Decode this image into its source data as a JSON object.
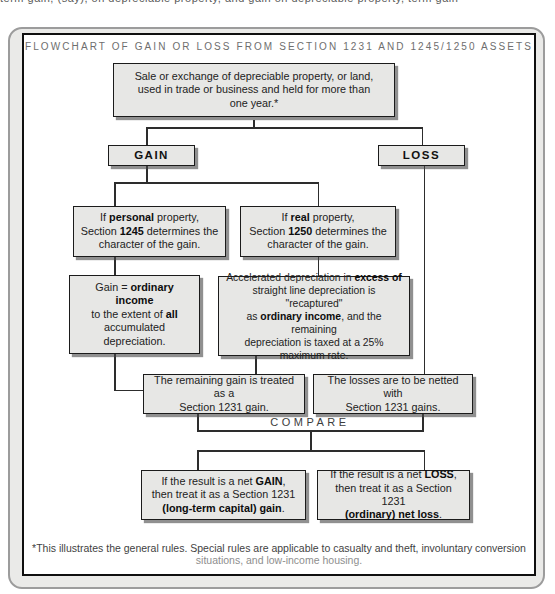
{
  "title": "FLOWCHART OF GAIN OR LOSS FROM SECTION 1231 AND 1245/1250 ASSETS",
  "top_cropped_line": "term gain, (say), on depreciable property, and gain on depreciable property, term gain",
  "compare_label": "COMPARE",
  "footnote": {
    "line1": "*This illustrates the general rules. Special rules are applicable to casualty and theft, involuntary conversion",
    "line2": "situations, and low-income housing."
  },
  "colors": {
    "box_fill": "#e7e7e5",
    "box_border": "#1b1b1b",
    "box_shadow": "#6f6f6f",
    "panel_fill": "#eaeae8",
    "panel_border": "#9c9c9c",
    "inner_border": "#0f0f0f",
    "connector": "#2d2d2d",
    "title_text": "#6e6e6e",
    "body_text": "#222222"
  },
  "nodes": {
    "intro": {
      "segments": [
        {
          "t": "Sale or exchange of depreciable property, or land,\nused in trade or business and held for more than\none year.*"
        }
      ]
    },
    "gain": {
      "label": "GAIN"
    },
    "loss": {
      "label": "LOSS"
    },
    "p1245": {
      "segments": [
        {
          "t": "If "
        },
        {
          "t": "personal",
          "b": true
        },
        {
          "t": " property,\nSection "
        },
        {
          "t": "1245",
          "b": true
        },
        {
          "t": " determines the\ncharacter of the gain."
        }
      ]
    },
    "p1250": {
      "segments": [
        {
          "t": "If "
        },
        {
          "t": "real",
          "b": true
        },
        {
          "t": " property,\nSection "
        },
        {
          "t": "1250",
          "b": true
        },
        {
          "t": " determines the\ncharacter of the gain."
        }
      ]
    },
    "gain_ordinary": {
      "segments": [
        {
          "t": "Gain = "
        },
        {
          "t": "ordinary income",
          "b": true
        },
        {
          "t": "\nto the extent of "
        },
        {
          "t": "all",
          "b": true
        },
        {
          "t": "\naccumulated depreciation."
        }
      ]
    },
    "accelerated": {
      "segments": [
        {
          "t": "Accelerated depreciation in "
        },
        {
          "t": "excess of",
          "b": true
        },
        {
          "t": "\nstraight line depreciation is \"recaptured\"\nas "
        },
        {
          "t": "ordinary income",
          "b": true
        },
        {
          "t": ", and the remaining\ndepreciation is taxed at a 25%\nmaximum rate."
        }
      ]
    },
    "remaining_gain": {
      "segments": [
        {
          "t": "The remaining gain is treated as a\nSection 1231 gain."
        }
      ]
    },
    "losses_netted": {
      "segments": [
        {
          "t": "The losses are to be netted with\nSection 1231 gains."
        }
      ]
    },
    "net_gain": {
      "segments": [
        {
          "t": "If the result is a net "
        },
        {
          "t": "GAIN",
          "b": true
        },
        {
          "t": ",\nthen treat it as a Section 1231\n"
        },
        {
          "t": "(long-term capital) gain",
          "b": true
        },
        {
          "t": "."
        }
      ]
    },
    "net_loss": {
      "segments": [
        {
          "t": "If the result is a net "
        },
        {
          "t": "LOSS",
          "b": true
        },
        {
          "t": ",\nthen treat it as a Section 1231\n"
        },
        {
          "t": "(ordinary) net loss",
          "b": true
        },
        {
          "t": "."
        }
      ]
    }
  }
}
